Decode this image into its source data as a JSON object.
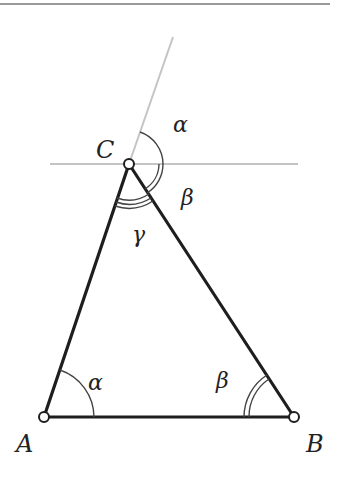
{
  "diagram": {
    "type": "triangle-angle-sum",
    "vertices": {
      "A": {
        "label": "A",
        "x": 44,
        "y": 417
      },
      "B": {
        "label": "B",
        "x": 294,
        "y": 417
      },
      "C": {
        "label": "C",
        "x": 129,
        "y": 164
      }
    },
    "angles": {
      "alpha": "α",
      "beta": "β",
      "gamma": "γ"
    },
    "colors": {
      "triangle": "#1e1e1e",
      "construction": "#bdbdbd",
      "arc": "#444444",
      "rule": "#9a9a9a"
    }
  }
}
